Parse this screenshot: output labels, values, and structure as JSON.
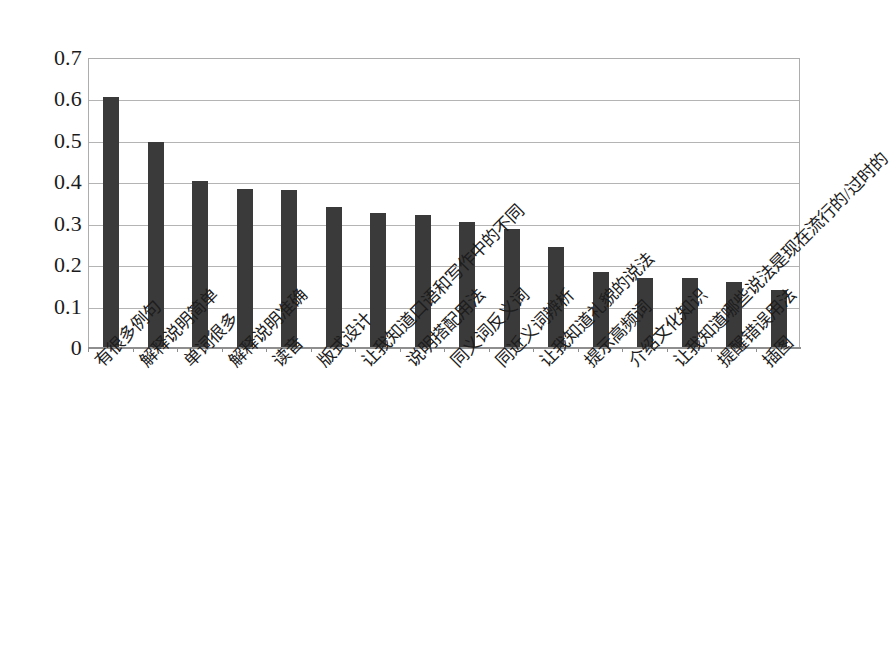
{
  "chart_data": {
    "type": "bar",
    "title": "",
    "subtitle": "",
    "xlabel": "",
    "ylabel": "",
    "ylim": [
      0,
      0.7
    ],
    "y_ticks": [
      "0",
      "0.1",
      "0.2",
      "0.3",
      "0.4",
      "0.5",
      "0.6",
      "0.7"
    ],
    "y_tick_values": [
      0,
      0.1,
      0.2,
      0.3,
      0.4,
      0.5,
      0.6,
      0.7
    ],
    "grid": true,
    "legend": "none",
    "orientation": "vertical",
    "bar_color": "#3a3a3a",
    "gridline_color": "#b4b4b4",
    "axis_color": "#8e8e8e",
    "background_color": "#ffffff",
    "categories": [
      "有很多例句",
      "解释说明简单",
      "单词很多",
      "解释说明准确",
      "读音",
      "版式设计",
      "让我知道口语和写作中的不同",
      "说明搭配用法",
      "同义词反义词",
      "同近义词辨析",
      "让我知道礼貌的说法",
      "提示高频词",
      "介绍文化知识",
      "让我知道哪些说法是现在流行的/过时的",
      "提醒错误用法",
      "插图"
    ],
    "values": [
      0.605,
      0.497,
      0.403,
      0.383,
      0.381,
      0.34,
      0.327,
      0.322,
      0.305,
      0.288,
      0.245,
      0.183,
      0.17,
      0.17,
      0.16,
      0.14
    ]
  }
}
